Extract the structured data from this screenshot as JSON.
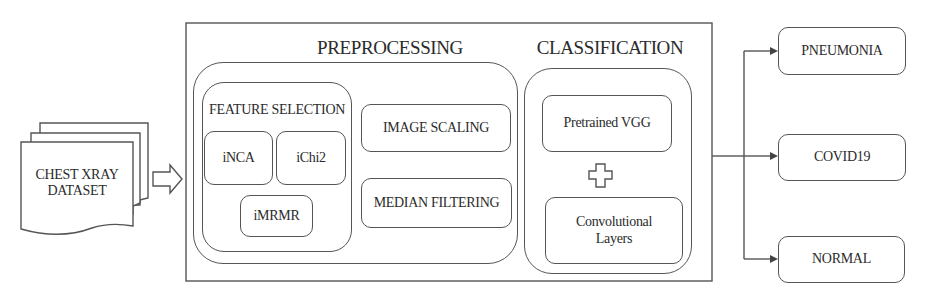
{
  "dataset": {
    "label_line1": "CHEST XRAY",
    "label_line2": "DATASET"
  },
  "preprocessing": {
    "title": "PREPROCESSING",
    "feature_selection": {
      "title": "FEATURE SELECTION",
      "methods": [
        "iNCA",
        "iChi2",
        "iMRMR"
      ]
    },
    "steps": [
      "IMAGE SCALING",
      "MEDIAN FILTERING"
    ]
  },
  "classification": {
    "title": "CLASSIFICATION",
    "components": [
      "Pretrained VGG",
      "Convolutional Layers"
    ],
    "combiner_icon": "plus-icon"
  },
  "outputs": [
    "PNEUMONIA",
    "COVID19",
    "NORMAL"
  ],
  "icons": {
    "dataset": "document-stack-icon",
    "flow_arrow": "hollow-arrow-right-icon"
  },
  "colors": {
    "stroke": "#555555",
    "text": "#2b2b2b",
    "background": "#ffffff"
  }
}
